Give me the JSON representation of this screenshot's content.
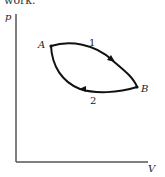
{
  "caption": "work.",
  "diagram": {
    "type": "pV cycle diagram",
    "axes": {
      "y_label": "p",
      "x_label": "V"
    },
    "points": [
      {
        "label": "A"
      },
      {
        "label": "B"
      }
    ],
    "paths": [
      {
        "label": "1",
        "from": "A",
        "to": "B",
        "position": "upper",
        "direction": "A to B"
      },
      {
        "label": "2",
        "from": "B",
        "to": "A",
        "position": "lower",
        "direction": "B to A"
      }
    ],
    "colors": {
      "line": "#111111",
      "axis": "#555555",
      "background": "#ffffff"
    }
  }
}
